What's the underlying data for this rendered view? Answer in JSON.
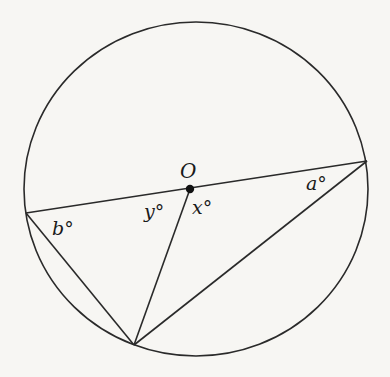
{
  "diagram": {
    "type": "circle-geometry",
    "colors": {
      "background": "#f7f6f3",
      "stroke": "#2a2a2a"
    },
    "circle": {
      "cx": 196,
      "cy": 189,
      "rx": 172,
      "ry": 167
    },
    "points": {
      "O": {
        "x": 190,
        "y": 189,
        "label": "O"
      },
      "left": {
        "x": 26,
        "y": 213
      },
      "right": {
        "x": 367,
        "y": 161
      },
      "bottom": {
        "x": 134,
        "y": 345
      }
    },
    "segments": [
      {
        "from": "left",
        "to": "right",
        "note": "diameter through O"
      },
      {
        "from": "left",
        "to": "bottom"
      },
      {
        "from": "O",
        "to": "bottom"
      },
      {
        "from": "right",
        "to": "bottom"
      }
    ],
    "angle_labels": {
      "a": "a°",
      "b": "b°",
      "x": "x°",
      "y": "y°"
    },
    "center_label": "O"
  }
}
